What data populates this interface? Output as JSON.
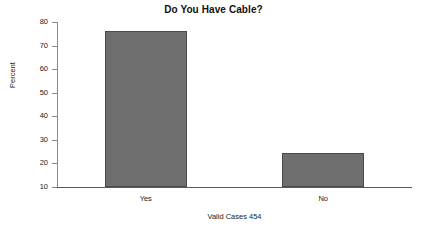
{
  "chart_data": {
    "type": "bar",
    "title": "Do You Have Cable?",
    "xlabel": "",
    "ylabel": "Percent",
    "categories": [
      "Yes",
      "No"
    ],
    "values": [
      76.2,
      24.4
    ],
    "ylim": [
      10,
      80
    ],
    "yticks": [
      10,
      20,
      30,
      40,
      50,
      60,
      70,
      80
    ],
    "ytick_labels": [
      "10",
      "20",
      "30",
      "40",
      "50",
      "60",
      "70",
      "80"
    ],
    "grid": false,
    "legend": "none",
    "annotation": "Valid Cases 454",
    "bar_color": "#6e6e6e",
    "bar_edge_color": "#4a4a4a",
    "axis_color": "#5a5a5a",
    "background_color": "#ffffff"
  },
  "footer": {
    "valid_cases_text": "Valid Cases 454"
  }
}
